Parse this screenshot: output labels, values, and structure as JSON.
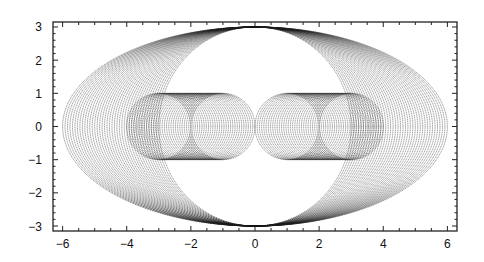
{
  "chart_data": {
    "type": "line",
    "title": "",
    "xlabel": "",
    "ylabel": "",
    "xlim": [
      -6.3,
      6.3
    ],
    "ylim": [
      -3.15,
      3.15
    ],
    "xticks": [
      -6,
      -4,
      -2,
      0,
      2,
      4,
      6
    ],
    "yticks": [
      -3,
      -2,
      -1,
      0,
      1,
      2,
      3
    ],
    "grid": false,
    "legend": null,
    "line_color": "#1a1a1a",
    "series": [
      {
        "name": "outer-ellipses",
        "shape": "ellipse",
        "center": [
          0,
          0
        ],
        "ry": 3,
        "rx_from": 3,
        "rx_to": 6,
        "count": 40
      },
      {
        "name": "left-circles",
        "shape": "circle",
        "r": 1,
        "cy": 0,
        "cx_from": -3,
        "cx_to": -1,
        "count": 30
      },
      {
        "name": "right-circles",
        "shape": "circle",
        "r": 1,
        "cy": 0,
        "cx_from": 1,
        "cx_to": 3,
        "count": 30
      }
    ]
  }
}
